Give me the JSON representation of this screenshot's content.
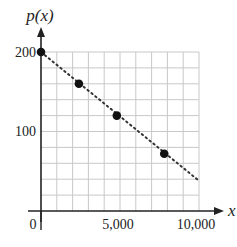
{
  "chart_data": {
    "type": "scatter",
    "title": "",
    "xlabel": "x",
    "ylabel": "p(x)",
    "xlim": [
      0,
      10000
    ],
    "ylim": [
      0,
      200
    ],
    "grid": true,
    "grid_x_step": 1000,
    "grid_y_step": 20,
    "x_ticks": [
      0,
      5000,
      10000
    ],
    "x_tick_labels": [
      "0",
      "5,000",
      "10,000"
    ],
    "y_ticks": [
      100,
      200
    ],
    "y_tick_labels": [
      "100",
      "200"
    ],
    "series": [
      {
        "name": "data points",
        "style": "filled-circle",
        "x": [
          0,
          2400,
          4800,
          7800
        ],
        "y": [
          200,
          160,
          120,
          72
        ]
      }
    ],
    "trend_line": {
      "style": "dotted",
      "from": [
        0,
        200
      ],
      "to": [
        10000,
        38
      ]
    },
    "legend": null
  },
  "labels": {
    "y_axis_label": "p(x)",
    "x_axis_label": "x",
    "origin_label": "0",
    "y_tick_100": "100",
    "y_tick_200": "200",
    "x_tick_5000": "5,000",
    "x_tick_10000": "10,000"
  },
  "colors": {
    "axis": "#222222",
    "grid": "#c8c8c8",
    "points": "#111111",
    "trend": "#333333"
  }
}
